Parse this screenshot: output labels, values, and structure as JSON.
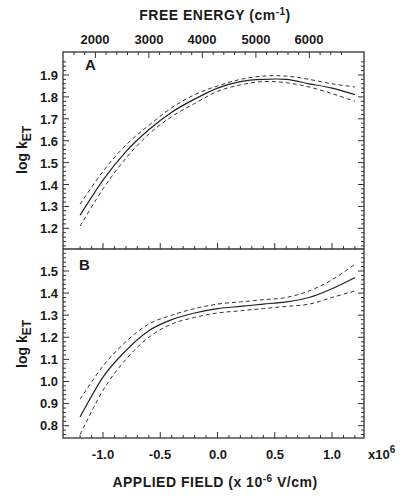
{
  "chart_data": [
    {
      "panel": "A",
      "type": "line",
      "top_axis": {
        "label": "FREE ENERGY (cm-1)",
        "label_text": "FREE ENERGY (cm",
        "label_sup": "-1",
        "label_close": ")",
        "ticks": [
          2000,
          3000,
          4000,
          5000,
          6000
        ]
      },
      "xlabel": "APPLIED FIELD (x 10-6 V/cm)",
      "ylabel": "log kET",
      "xlim": [
        -1.25,
        1.25
      ],
      "ylim": [
        1.1,
        1.97
      ],
      "yticks": [
        1.2,
        1.3,
        1.4,
        1.5,
        1.6,
        1.7,
        1.8,
        1.9
      ],
      "x": [
        -1.2,
        -1.0,
        -0.8,
        -0.6,
        -0.4,
        -0.2,
        0.0,
        0.2,
        0.4,
        0.6,
        0.8,
        1.0,
        1.2
      ],
      "series": [
        {
          "name": "fit",
          "style": "solid",
          "values": [
            1.26,
            1.42,
            1.55,
            1.65,
            1.73,
            1.79,
            1.84,
            1.87,
            1.88,
            1.88,
            1.86,
            1.84,
            1.81
          ]
        },
        {
          "name": "upper bound",
          "style": "dashed",
          "values": [
            1.31,
            1.46,
            1.58,
            1.67,
            1.75,
            1.81,
            1.85,
            1.88,
            1.895,
            1.895,
            1.88,
            1.86,
            1.845
          ]
        },
        {
          "name": "lower bound",
          "style": "dashed",
          "values": [
            1.21,
            1.38,
            1.52,
            1.63,
            1.71,
            1.77,
            1.825,
            1.855,
            1.87,
            1.865,
            1.845,
            1.815,
            1.78
          ]
        }
      ],
      "grid": false
    },
    {
      "panel": "B",
      "type": "line",
      "xlabel": "APPLIED FIELD (x 10-6 V/cm)",
      "ylabel": "log kET",
      "xlim": [
        -1.25,
        1.25
      ],
      "ylim": [
        0.7,
        1.6
      ],
      "yticks": [
        0.8,
        0.9,
        1.0,
        1.1,
        1.2,
        1.3,
        1.4,
        1.5
      ],
      "xticks": [
        -1.0,
        -0.5,
        0.0,
        0.5,
        1.0
      ],
      "x_multiplier": "x10^6",
      "x": [
        -1.2,
        -1.0,
        -0.8,
        -0.6,
        -0.4,
        -0.2,
        0.0,
        0.2,
        0.4,
        0.6,
        0.8,
        1.0,
        1.2
      ],
      "series": [
        {
          "name": "fit",
          "style": "solid",
          "values": [
            0.84,
            1.02,
            1.14,
            1.23,
            1.28,
            1.31,
            1.33,
            1.34,
            1.35,
            1.36,
            1.38,
            1.42,
            1.47
          ]
        },
        {
          "name": "upper bound",
          "style": "dashed",
          "values": [
            0.92,
            1.07,
            1.18,
            1.26,
            1.3,
            1.33,
            1.35,
            1.36,
            1.37,
            1.38,
            1.41,
            1.46,
            1.53
          ]
        },
        {
          "name": "lower bound",
          "style": "dashed",
          "values": [
            0.76,
            0.96,
            1.1,
            1.2,
            1.26,
            1.29,
            1.31,
            1.32,
            1.33,
            1.34,
            1.35,
            1.38,
            1.41
          ]
        }
      ],
      "grid": false
    }
  ],
  "labels": {
    "top_title": "FREE ENERGY (cm",
    "top_sup": "-1",
    "top_close": ")",
    "top_ticks": [
      "2000",
      "3000",
      "4000",
      "5000",
      "6000"
    ],
    "panel_a": "A",
    "panel_b": "B",
    "ylabel_main": "log k",
    "ylabel_sub": "ET",
    "a_yticks": [
      "1.9",
      "1.8",
      "1.7",
      "1.6",
      "1.5",
      "1.4",
      "1.3",
      "1.2"
    ],
    "b_yticks": [
      "1.5",
      "1.4",
      "1.3",
      "1.2",
      "1.1",
      "1.0",
      "0.9",
      "0.8"
    ],
    "xticks": [
      "-1.0",
      "-0.5",
      "0.0",
      "0.5",
      "1.0"
    ],
    "x_mult": "x10",
    "x_mult_sup": "6",
    "xlabel_pre": "APPLIED FIELD (x 10",
    "xlabel_sup": "-6",
    "xlabel_post": " V/cm)"
  }
}
